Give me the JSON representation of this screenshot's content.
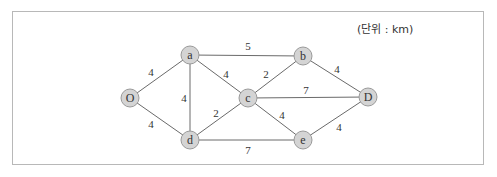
{
  "unit_label": "(단위 : km)",
  "nodes": [
    {
      "id": "O",
      "label": "O",
      "x": 130,
      "y": 98
    },
    {
      "id": "a",
      "label": "a",
      "x": 190,
      "y": 55
    },
    {
      "id": "b",
      "label": "b",
      "x": 303,
      "y": 56
    },
    {
      "id": "c",
      "label": "c",
      "x": 248,
      "y": 98
    },
    {
      "id": "d",
      "label": "d",
      "x": 190,
      "y": 140
    },
    {
      "id": "e",
      "label": "e",
      "x": 303,
      "y": 140
    },
    {
      "id": "D",
      "label": "D",
      "x": 368,
      "y": 97
    }
  ],
  "edges": [
    {
      "from": "O",
      "to": "a",
      "weight": "4",
      "lx": 151,
      "ly": 72
    },
    {
      "from": "O",
      "to": "d",
      "weight": "4",
      "lx": 151,
      "ly": 124
    },
    {
      "from": "a",
      "to": "b",
      "weight": "5",
      "lx": 248,
      "ly": 46
    },
    {
      "from": "a",
      "to": "d",
      "weight": "4",
      "lx": 184,
      "ly": 98
    },
    {
      "from": "a",
      "to": "c",
      "weight": "4",
      "lx": 226,
      "ly": 74
    },
    {
      "from": "b",
      "to": "c",
      "weight": "2",
      "lx": 266,
      "ly": 74
    },
    {
      "from": "b",
      "to": "D",
      "weight": "4",
      "lx": 337,
      "ly": 69
    },
    {
      "from": "c",
      "to": "D",
      "weight": "7",
      "lx": 306,
      "ly": 90
    },
    {
      "from": "c",
      "to": "d",
      "weight": "2",
      "lx": 216,
      "ly": 113
    },
    {
      "from": "c",
      "to": "e",
      "weight": "4",
      "lx": 282,
      "ly": 115
    },
    {
      "from": "d",
      "to": "e",
      "weight": "7",
      "lx": 248,
      "ly": 150
    },
    {
      "from": "e",
      "to": "D",
      "weight": "4",
      "lx": 339,
      "ly": 127
    }
  ]
}
